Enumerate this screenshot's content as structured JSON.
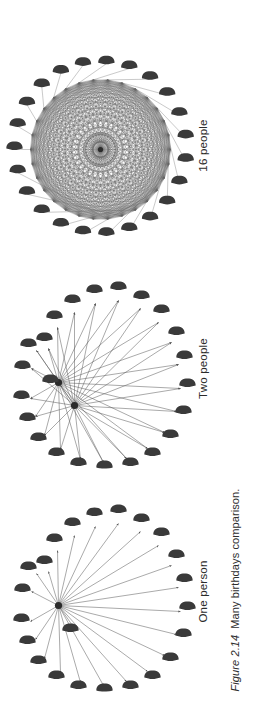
{
  "figure": {
    "caption_number": "Figure 2.14",
    "caption_text": "Many birthdays comparison.",
    "background_color": "#ffffff",
    "ink_color": "#3a3a3a",
    "edge_color": "#555555",
    "orientation": "rotated-90-ccw",
    "icon_name": "person-bust-icon"
  },
  "panels": [
    {
      "id": "one-person",
      "label": "One person",
      "people_count": 23,
      "hubs": 1,
      "edges": 23,
      "description": "One central person connected by arrows to every other person on the ring"
    },
    {
      "id": "two-people",
      "label": "Two people",
      "people_count": 23,
      "hubs": 2,
      "edges": 45,
      "description": "Two central people each connected by arrows to every other person on the ring"
    },
    {
      "id": "sixteen-people",
      "label": "16 people",
      "people_count": 23,
      "hubs": 16,
      "edges": 253,
      "description": "Sixteen people all connected to each other forming a dense mesh"
    }
  ],
  "chart_data": {
    "type": "diagram",
    "title": "Many birthdays comparison",
    "categories": [
      "One person",
      "Two people",
      "16 people"
    ],
    "values": [
      23,
      45,
      253
    ],
    "ylabel": "Number of pair comparisons",
    "xlabel": "",
    "annotations": [
      "One person: 23 comparisons",
      "Two people: 45 comparisons",
      "16 people: 253 comparisons"
    ]
  }
}
